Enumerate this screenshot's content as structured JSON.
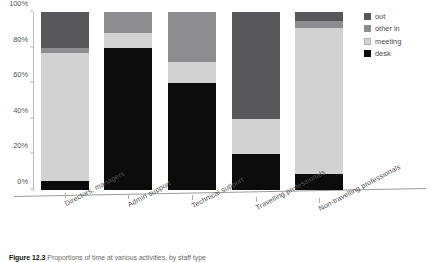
{
  "figure": {
    "number_label": "Figure 12.3",
    "caption_text": "Proportions of time at various activities, by staff type"
  },
  "legend": {
    "position": "right",
    "items": [
      {
        "label": "out",
        "color": "#58585a",
        "icon": "legend-swatch"
      },
      {
        "label": "other in",
        "color": "#8d8d8f",
        "icon": "legend-swatch"
      },
      {
        "label": "meeting",
        "color": "#d2d2d2",
        "icon": "legend-swatch"
      },
      {
        "label": "desk",
        "color": "#0c0c0c",
        "icon": "legend-swatch"
      }
    ]
  },
  "chart_data": {
    "type": "bar",
    "stacked": true,
    "normalized_percent": true,
    "title": "",
    "subtitle": "",
    "xlabel": "",
    "ylabel": "",
    "ylim": [
      0,
      100
    ],
    "yticks": [
      0,
      20,
      40,
      60,
      80,
      100
    ],
    "ytick_labels": [
      "0%",
      "20%",
      "40%",
      "60%",
      "80%",
      "100%"
    ],
    "grid": false,
    "legend_position": "right",
    "categories": [
      "Directors, managers",
      "Admin support",
      "Technical support",
      "Travelling professionals",
      "Non-travelling professionals"
    ],
    "series": [
      {
        "name": "desk",
        "color": "#0c0c0c",
        "values": [
          5,
          80,
          60,
          20,
          9
        ]
      },
      {
        "name": "meeting",
        "color": "#d2d2d2",
        "values": [
          72,
          8,
          12,
          20,
          82
        ]
      },
      {
        "name": "other in",
        "color": "#8d8d8f",
        "values": [
          3,
          12,
          28,
          0,
          4
        ]
      },
      {
        "name": "out",
        "color": "#58585a",
        "values": [
          20,
          0,
          0,
          60,
          5
        ]
      }
    ]
  }
}
